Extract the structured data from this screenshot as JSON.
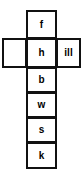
{
  "figure": {
    "shape": "cross",
    "background_color": "#ffffff",
    "border_color": "#111111",
    "text_color": "#000000"
  },
  "grid": {
    "column_cells": [
      {
        "id": "f",
        "label": "f"
      },
      {
        "id": "h",
        "label": "h"
      },
      {
        "id": "b",
        "label": "b"
      },
      {
        "id": "w",
        "label": "w"
      },
      {
        "id": "s",
        "label": "s"
      },
      {
        "id": "k",
        "label": "k"
      }
    ],
    "row_cells": [
      {
        "id": "left",
        "label": ""
      },
      {
        "id": "right",
        "label": "ill"
      }
    ]
  }
}
